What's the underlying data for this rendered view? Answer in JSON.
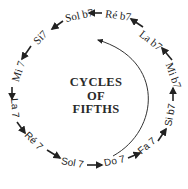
{
  "title": {
    "line1": "CYCLES",
    "line2": "OF",
    "line3": "FIFTHS"
  },
  "chords": [
    {
      "label": "Ré b7",
      "x": 118,
      "y": 15,
      "rotate": 8,
      "font": "serif"
    },
    {
      "label": "Sol b7",
      "x": 79,
      "y": 15,
      "rotate": -12,
      "font": "serif"
    },
    {
      "label": "Si7",
      "x": 40,
      "y": 37,
      "rotate": -45,
      "font": "serif"
    },
    {
      "label": "Mi 7",
      "x": 18,
      "y": 71,
      "rotate": -72,
      "font": "serif"
    },
    {
      "label": "La 7",
      "x": 14,
      "y": 108,
      "rotate": 85,
      "font": "sans"
    },
    {
      "label": "Ré 7",
      "x": 33,
      "y": 141,
      "rotate": 45,
      "font": "sans"
    },
    {
      "label": "Sol 7",
      "x": 72,
      "y": 163,
      "rotate": 10,
      "font": "sans"
    },
    {
      "label": "Do 7",
      "x": 114,
      "y": 161,
      "rotate": -12,
      "font": "sans"
    },
    {
      "label": "Fa 7",
      "x": 147,
      "y": 146,
      "rotate": -40,
      "font": "sans"
    },
    {
      "label": "Si b7",
      "x": 170,
      "y": 115,
      "rotate": -80,
      "font": "sans"
    },
    {
      "label": "Mi b7",
      "x": 173,
      "y": 75,
      "rotate": 70,
      "font": "serif"
    },
    {
      "label": "La b7",
      "x": 150,
      "y": 40,
      "rotate": 38,
      "font": "serif"
    }
  ],
  "arrows": [
    {
      "from": "Ré b7",
      "to": "Sol b7",
      "x1": 102,
      "y1": 13,
      "x2": 89,
      "y2": 13
    },
    {
      "from": "Sol b7",
      "to": "Si7",
      "x1": 63,
      "y1": 21,
      "x2": 52,
      "y2": 29
    },
    {
      "from": "Si7",
      "to": "Mi 7",
      "x1": 31,
      "y1": 46,
      "x2": 22,
      "y2": 59
    },
    {
      "from": "Mi 7",
      "to": "La 7",
      "x1": 12,
      "y1": 87,
      "x2": 12,
      "y2": 99
    },
    {
      "from": "La 7",
      "to": "Ré 7",
      "x1": 17,
      "y1": 122,
      "x2": 25,
      "y2": 133
    },
    {
      "from": "Ré 7",
      "to": "Sol 7",
      "x1": 47,
      "y1": 150,
      "x2": 60,
      "y2": 158
    },
    {
      "from": "Sol 7",
      "to": "Do 7",
      "x1": 87,
      "y1": 165,
      "x2": 102,
      "y2": 165
    },
    {
      "from": "Do 7",
      "to": "Fa 7",
      "x1": 128,
      "y1": 158,
      "x2": 140,
      "y2": 153
    },
    {
      "from": "Fa 7",
      "to": "Si b7",
      "x1": 158,
      "y1": 141,
      "x2": 166,
      "y2": 129
    },
    {
      "from": "Si b7",
      "to": "Mi b7",
      "x1": 173,
      "y1": 101,
      "x2": 173,
      "y2": 88
    },
    {
      "from": "Mi b7",
      "to": "La b7",
      "x1": 172,
      "y1": 60,
      "x2": 162,
      "y2": 48
    },
    {
      "from": "La b7",
      "to": "Ré b7",
      "x1": 143,
      "y1": 27,
      "x2": 131,
      "y2": 19
    }
  ],
  "inner_arc": {
    "path": "M 113 156 C 160 130, 165 60, 98 40",
    "arrowhead_at": [
      96,
      40
    ]
  },
  "colors": {
    "ink": "#222222",
    "background": "#ffffff"
  }
}
